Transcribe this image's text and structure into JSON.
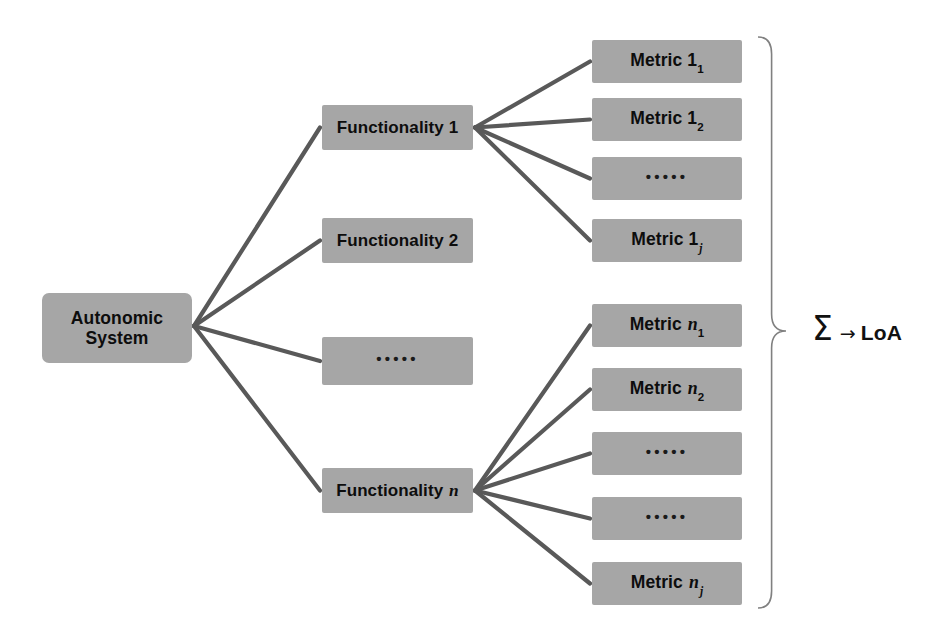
{
  "diagram": {
    "background_color": "#ffffff",
    "node_fill_color": "#a6a6a6",
    "edge_color": "#595959",
    "brace_color": "#808080",
    "text_color": "#0d0d0d"
  },
  "root": {
    "line1": "Autonomic",
    "line2": "System",
    "x": 42,
    "y": 293,
    "w": 150,
    "h": 70
  },
  "functionalities": [
    {
      "label": "Functionality",
      "index": "1",
      "index_italic": false,
      "x": 322,
      "y": 105,
      "w": 151,
      "h": 45
    },
    {
      "label": "Functionality",
      "index": "2",
      "index_italic": false,
      "x": 322,
      "y": 218,
      "w": 151,
      "h": 45
    },
    {
      "label": "",
      "index": "",
      "ellipsis": true,
      "dots": "•••••",
      "x": 322,
      "y": 337,
      "w": 151,
      "h": 48
    },
    {
      "label": "Functionality",
      "index": "n",
      "index_italic": true,
      "x": 322,
      "y": 468,
      "w": 151,
      "h": 45
    }
  ],
  "metric_groups": [
    {
      "group": "group-1",
      "parent": "Functionality 1",
      "metrics": [
        {
          "label": "Metric",
          "base": "1",
          "base_italic": false,
          "sub": "1",
          "sub_italic": false,
          "x": 592,
          "y": 40,
          "w": 150,
          "h": 43
        },
        {
          "label": "Metric",
          "base": "1",
          "base_italic": false,
          "sub": "2",
          "sub_italic": false,
          "x": 592,
          "y": 98,
          "w": 150,
          "h": 43
        },
        {
          "label": "",
          "ellipsis": true,
          "dots": "•••••",
          "x": 592,
          "y": 157,
          "w": 150,
          "h": 43
        },
        {
          "label": "Metric",
          "base": "1",
          "base_italic": false,
          "sub": "j",
          "sub_italic": true,
          "x": 592,
          "y": 219,
          "w": 150,
          "h": 43
        }
      ]
    },
    {
      "group": "group-n",
      "parent": "Functionality n",
      "metrics": [
        {
          "label": "Metric",
          "base": "n",
          "base_italic": true,
          "sub": "1",
          "sub_italic": false,
          "x": 592,
          "y": 304,
          "w": 150,
          "h": 43
        },
        {
          "label": "Metric",
          "base": "n",
          "base_italic": true,
          "sub": "2",
          "sub_italic": false,
          "x": 592,
          "y": 368,
          "w": 150,
          "h": 43
        },
        {
          "label": "",
          "ellipsis": true,
          "dots": "•••••",
          "x": 592,
          "y": 432,
          "w": 150,
          "h": 43
        },
        {
          "label": "",
          "ellipsis": true,
          "dots": "•••••",
          "x": 592,
          "y": 497,
          "w": 150,
          "h": 43
        },
        {
          "label": "Metric",
          "base": "n",
          "base_italic": true,
          "sub": "j",
          "sub_italic": true,
          "x": 592,
          "y": 562,
          "w": 150,
          "h": 43
        }
      ]
    }
  ],
  "aggregation": {
    "sigma": "Σ",
    "arrow": "→",
    "result": "LoA",
    "x": 812,
    "y": 312
  },
  "brace": {
    "top": 37,
    "bottom": 608,
    "tip_y": 331,
    "x": 756,
    "width": 30
  }
}
